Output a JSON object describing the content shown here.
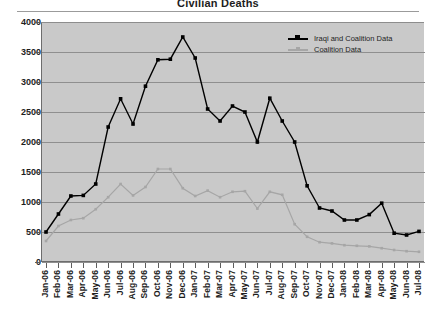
{
  "chart_data": {
    "type": "line",
    "title": "Civilian Deaths",
    "xlabel": "",
    "ylabel": "",
    "ylim": [
      0,
      4000
    ],
    "yticks": [
      0,
      500,
      1000,
      1500,
      2000,
      2500,
      3000,
      3500,
      4000
    ],
    "grid": true,
    "legend_position": "top-right",
    "categories": [
      "Jan-06",
      "Feb-06",
      "Mar-06",
      "Apr-06",
      "May-06",
      "Jun-06",
      "Jul-06",
      "Aug-06",
      "Sep-06",
      "Oct-06",
      "Nov-06",
      "Dec-06",
      "Jan-07",
      "Feb-07",
      "Mar-07",
      "Apr-07",
      "May-07",
      "Jun-07",
      "Jul-07",
      "Aug-07",
      "Sep-07",
      "Oct-07",
      "Nov-07",
      "Dec-07",
      "Jan-08",
      "Feb-08",
      "Mar-08",
      "Apr-08",
      "May-08",
      "Jun-08",
      "Jul-08"
    ],
    "series": [
      {
        "name": "Iraqi and Coalition Data",
        "color": "#000000",
        "marker": "square",
        "values": [
          500,
          800,
          1100,
          1110,
          1300,
          2250,
          2720,
          2300,
          2930,
          3370,
          3380,
          3750,
          3400,
          2550,
          2350,
          2600,
          2500,
          2000,
          2730,
          2350,
          2000,
          1270,
          900,
          850,
          700,
          700,
          790,
          980,
          480,
          450,
          510
        ]
      },
      {
        "name": "Coalition Data",
        "color": "#a6a6a6",
        "marker": "diamond",
        "values": [
          350,
          600,
          700,
          730,
          880,
          1080,
          1300,
          1110,
          1250,
          1550,
          1550,
          1230,
          1100,
          1190,
          1080,
          1170,
          1180,
          890,
          1170,
          1120,
          630,
          420,
          330,
          310,
          280,
          270,
          260,
          230,
          200,
          180,
          170
        ]
      }
    ]
  },
  "legend": {
    "items": [
      {
        "label": "Iraqi and Coalition Data"
      },
      {
        "label": "Coalition Data"
      }
    ]
  }
}
